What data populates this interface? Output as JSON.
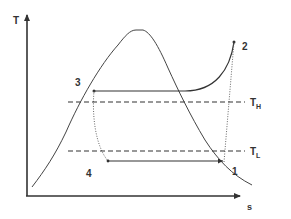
{
  "diagram": {
    "axes": {
      "y_label": "T",
      "x_label": "s"
    },
    "states": [
      {
        "id": "1",
        "label": "1",
        "x": 224,
        "y": 162
      },
      {
        "id": "2",
        "label": "2",
        "x": 234,
        "y": 42
      },
      {
        "id": "3",
        "label": "3",
        "x": 94,
        "y": 91
      },
      {
        "id": "4",
        "label": "4",
        "x": 108,
        "y": 161
      }
    ],
    "reservoirs": {
      "high": {
        "label_main": "T",
        "label_sub": "H"
      },
      "low": {
        "label_main": "T",
        "label_sub": "L"
      }
    },
    "colors": {
      "line": "#333333",
      "background": "#ffffff"
    }
  }
}
